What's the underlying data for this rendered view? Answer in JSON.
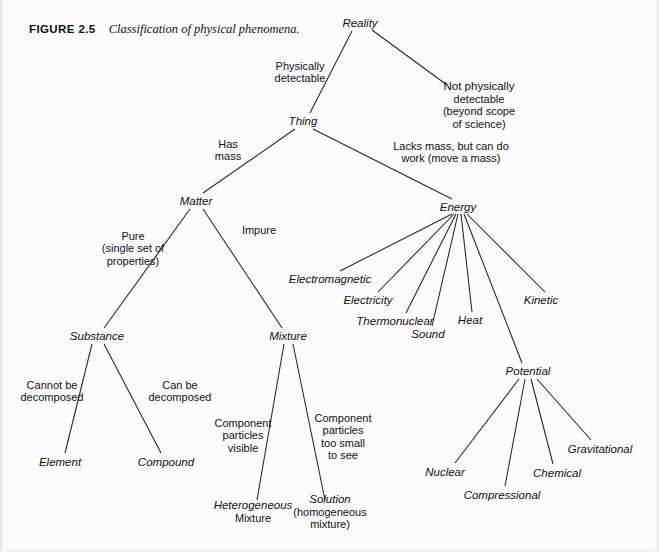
{
  "caption": {
    "figure_label": "FIGURE 2.5",
    "text": "Classification of physical phenomena."
  },
  "colors": {
    "background": "#fbfbfb",
    "ink": "#111111",
    "line": "#232323"
  },
  "chart_data": {
    "type": "diagram",
    "title": "Classification of physical phenomena",
    "layout": "top-down tree",
    "nodes": [
      {
        "id": "reality",
        "label": "Reality",
        "sublabel": "",
        "x": 360,
        "y": 23,
        "italic": true
      },
      {
        "id": "not_detectable",
        "label": "Not physically",
        "sublabel": "detectable|(beyond scope|of science)",
        "x": 479,
        "y": 105,
        "italic": false
      },
      {
        "id": "thing",
        "label": "Thing",
        "sublabel": "",
        "x": 303,
        "y": 121,
        "italic": true
      },
      {
        "id": "matter",
        "label": "Matter",
        "sublabel": "",
        "x": 196,
        "y": 201,
        "italic": true
      },
      {
        "id": "energy",
        "label": "Energy",
        "sublabel": "",
        "x": 458,
        "y": 207,
        "italic": true
      },
      {
        "id": "substance",
        "label": "Substance",
        "sublabel": "",
        "x": 97,
        "y": 336,
        "italic": true
      },
      {
        "id": "mixture",
        "label": "Mixture",
        "sublabel": "",
        "x": 288,
        "y": 336,
        "italic": true
      },
      {
        "id": "element",
        "label": "Element",
        "sublabel": "",
        "x": 60,
        "y": 462,
        "italic": true
      },
      {
        "id": "compound",
        "label": "Compound",
        "sublabel": "",
        "x": 166,
        "y": 462,
        "italic": true
      },
      {
        "id": "heterogeneous",
        "label": "Heterogeneous",
        "sublabel": "Mixture",
        "x": 253,
        "y": 512,
        "italic": true
      },
      {
        "id": "solution",
        "label": "Solution",
        "sublabel": "(homogeneous|mixture)",
        "x": 330,
        "y": 512,
        "italic": true
      },
      {
        "id": "electromagnetic",
        "label": "Electromagnetic",
        "sublabel": "",
        "x": 330,
        "y": 279,
        "italic": true
      },
      {
        "id": "electricity",
        "label": "Electricity",
        "sublabel": "",
        "x": 368,
        "y": 300,
        "italic": true
      },
      {
        "id": "thermonuclear",
        "label": "Thermonuclear",
        "sublabel": "",
        "x": 395,
        "y": 321,
        "italic": true
      },
      {
        "id": "sound",
        "label": "Sound",
        "sublabel": "",
        "x": 428,
        "y": 334,
        "italic": true
      },
      {
        "id": "heat",
        "label": "Heat",
        "sublabel": "",
        "x": 470,
        "y": 320,
        "italic": true
      },
      {
        "id": "kinetic",
        "label": "Kinetic",
        "sublabel": "",
        "x": 541,
        "y": 300,
        "italic": true
      },
      {
        "id": "potential",
        "label": "Potential",
        "sublabel": "",
        "x": 528,
        "y": 371,
        "italic": true
      },
      {
        "id": "nuclear",
        "label": "Nuclear",
        "sublabel": "",
        "x": 445,
        "y": 472,
        "italic": true
      },
      {
        "id": "compressional",
        "label": "Compressional",
        "sublabel": "",
        "x": 502,
        "y": 495,
        "italic": true
      },
      {
        "id": "chemical",
        "label": "Chemical",
        "sublabel": "",
        "x": 557,
        "y": 473,
        "italic": true
      },
      {
        "id": "gravitational",
        "label": "Gravitational",
        "sublabel": "",
        "x": 600,
        "y": 449,
        "italic": true
      }
    ],
    "edges": [
      {
        "from": "reality",
        "to": "thing",
        "x1": 352,
        "y1": 31,
        "x2": 310,
        "y2": 113
      },
      {
        "from": "reality",
        "to": "not_detectable",
        "x1": 372,
        "y1": 30,
        "x2": 447,
        "y2": 85
      },
      {
        "from": "thing",
        "to": "matter",
        "x1": 295,
        "y1": 129,
        "x2": 203,
        "y2": 193
      },
      {
        "from": "thing",
        "to": "energy",
        "x1": 313,
        "y1": 129,
        "x2": 452,
        "y2": 199
      },
      {
        "from": "matter",
        "to": "substance",
        "x1": 190,
        "y1": 209,
        "x2": 104,
        "y2": 328
      },
      {
        "from": "matter",
        "to": "mixture",
        "x1": 203,
        "y1": 209,
        "x2": 282,
        "y2": 328
      },
      {
        "from": "substance",
        "to": "element",
        "x1": 92,
        "y1": 344,
        "x2": 65,
        "y2": 453
      },
      {
        "from": "substance",
        "to": "compound",
        "x1": 104,
        "y1": 344,
        "x2": 161,
        "y2": 453
      },
      {
        "from": "mixture",
        "to": "heterogeneous",
        "x1": 284,
        "y1": 344,
        "x2": 257,
        "y2": 500
      },
      {
        "from": "mixture",
        "to": "solution",
        "x1": 293,
        "y1": 344,
        "x2": 325,
        "y2": 500
      },
      {
        "from": "energy",
        "to": "electromagnetic",
        "x1": 452,
        "y1": 214,
        "x2": 340,
        "y2": 271
      },
      {
        "from": "energy",
        "to": "electricity",
        "x1": 454,
        "y1": 214,
        "x2": 378,
        "y2": 292
      },
      {
        "from": "energy",
        "to": "thermonuclear",
        "x1": 456,
        "y1": 214,
        "x2": 406,
        "y2": 313
      },
      {
        "from": "energy",
        "to": "sound",
        "x1": 458,
        "y1": 214,
        "x2": 432,
        "y2": 326
      },
      {
        "from": "energy",
        "to": "heat",
        "x1": 461,
        "y1": 214,
        "x2": 472,
        "y2": 312
      },
      {
        "from": "energy",
        "to": "potential",
        "x1": 464,
        "y1": 214,
        "x2": 522,
        "y2": 363
      },
      {
        "from": "energy",
        "to": "kinetic",
        "x1": 467,
        "y1": 214,
        "x2": 545,
        "y2": 292
      },
      {
        "from": "potential",
        "to": "nuclear",
        "x1": 519,
        "y1": 379,
        "x2": 455,
        "y2": 463
      },
      {
        "from": "potential",
        "to": "compressional",
        "x1": 525,
        "y1": 379,
        "x2": 505,
        "y2": 486
      },
      {
        "from": "potential",
        "to": "chemical",
        "x1": 531,
        "y1": 379,
        "x2": 553,
        "y2": 464
      },
      {
        "from": "potential",
        "to": "gravitational",
        "x1": 537,
        "y1": 379,
        "x2": 591,
        "y2": 440
      }
    ],
    "edge_labels": [
      {
        "id": "physically-detectable",
        "lines": "Physically|detectable",
        "x": 300,
        "y": 72
      },
      {
        "id": "has-mass",
        "lines": "Has|mass",
        "x": 228,
        "y": 150
      },
      {
        "id": "lacks-mass",
        "lines": "Lacks mass, but can do|work (move a mass)",
        "x": 451,
        "y": 152
      },
      {
        "id": "pure",
        "lines": "Pure|(single set of|properties)",
        "x": 133,
        "y": 248
      },
      {
        "id": "impure",
        "lines": "Impure",
        "x": 259,
        "y": 230
      },
      {
        "id": "cannot-be-decomposed",
        "lines": "Cannot be|decomposed",
        "x": 52,
        "y": 391
      },
      {
        "id": "can-be-decomposed",
        "lines": "Can be|decomposed",
        "x": 180,
        "y": 391
      },
      {
        "id": "particles-visible",
        "lines": "Component|particles|visible",
        "x": 243,
        "y": 435
      },
      {
        "id": "particles-too-small",
        "lines": "Component|particles|too small|to see",
        "x": 343,
        "y": 437
      }
    ]
  }
}
